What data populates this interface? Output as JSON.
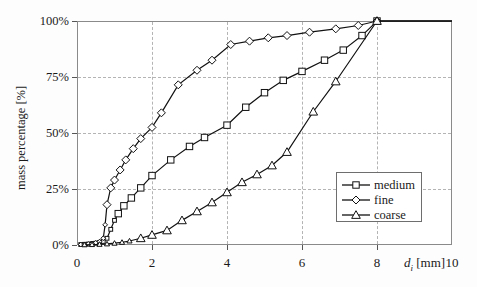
{
  "chart_data": {
    "type": "line",
    "title": "",
    "subtitle": "",
    "xlabel": "d_i [mm]",
    "ylabel": "mass percentage [%]",
    "xlim": [
      0,
      10
    ],
    "ylim": [
      0,
      100
    ],
    "grid": true,
    "legend_position": "inside-lower-right",
    "x_ticks": [
      "0",
      "2",
      "4",
      "6",
      "8",
      "10"
    ],
    "x_tick_values": [
      0,
      2,
      4,
      6,
      8,
      10
    ],
    "y_ticks": [
      "0%",
      "25%",
      "50%",
      "75%",
      "100%"
    ],
    "y_tick_values": [
      0,
      25,
      50,
      75,
      100
    ],
    "series": [
      {
        "name": "medium",
        "marker": "square",
        "points": [
          [
            0.1,
            0.2
          ],
          [
            0.2,
            0.3
          ],
          [
            0.3,
            0.4
          ],
          [
            0.4,
            0.6
          ],
          [
            0.5,
            0.8
          ],
          [
            0.6,
            1.1
          ],
          [
            0.7,
            1.6
          ],
          [
            0.8,
            3.0
          ],
          [
            0.9,
            7.0
          ],
          [
            1.0,
            11.0
          ],
          [
            1.1,
            14.0
          ],
          [
            1.25,
            17.5
          ],
          [
            1.45,
            21.0
          ],
          [
            1.7,
            25.5
          ],
          [
            2.0,
            31.0
          ],
          [
            2.5,
            38.0
          ],
          [
            3.0,
            44.0
          ],
          [
            3.4,
            48.0
          ],
          [
            4.0,
            53.5
          ],
          [
            4.5,
            61.5
          ],
          [
            5.0,
            68.0
          ],
          [
            5.5,
            73.5
          ],
          [
            6.0,
            77.5
          ],
          [
            6.6,
            82.5
          ],
          [
            7.1,
            87.0
          ],
          [
            7.6,
            93.5
          ],
          [
            8.0,
            100.0
          ],
          [
            10.0,
            100.0
          ]
        ]
      },
      {
        "name": "fine",
        "marker": "diamond",
        "points": [
          [
            0.1,
            0.2
          ],
          [
            0.2,
            0.3
          ],
          [
            0.3,
            0.5
          ],
          [
            0.4,
            0.7
          ],
          [
            0.5,
            1.0
          ],
          [
            0.6,
            1.5
          ],
          [
            0.7,
            3.0
          ],
          [
            0.75,
            9.0
          ],
          [
            0.8,
            18.0
          ],
          [
            0.9,
            25.5
          ],
          [
            1.0,
            29.0
          ],
          [
            1.15,
            33.5
          ],
          [
            1.3,
            38.0
          ],
          [
            1.5,
            43.0
          ],
          [
            1.7,
            47.5
          ],
          [
            2.0,
            52.5
          ],
          [
            2.25,
            59.0
          ],
          [
            2.7,
            71.5
          ],
          [
            3.2,
            78.0
          ],
          [
            3.6,
            82.5
          ],
          [
            4.1,
            89.5
          ],
          [
            4.6,
            91.0
          ],
          [
            5.1,
            92.5
          ],
          [
            5.6,
            93.5
          ],
          [
            6.2,
            95.0
          ],
          [
            6.9,
            96.5
          ],
          [
            7.5,
            98.0
          ],
          [
            8.0,
            100.0
          ],
          [
            10.0,
            100.0
          ]
        ]
      },
      {
        "name": "coarse",
        "marker": "triangle",
        "points": [
          [
            0.2,
            0.1
          ],
          [
            0.4,
            0.2
          ],
          [
            0.6,
            0.3
          ],
          [
            0.8,
            0.5
          ],
          [
            1.0,
            0.8
          ],
          [
            1.2,
            1.2
          ],
          [
            1.4,
            1.8
          ],
          [
            1.7,
            3.0
          ],
          [
            2.0,
            4.5
          ],
          [
            2.4,
            6.5
          ],
          [
            2.8,
            11.0
          ],
          [
            3.2,
            15.0
          ],
          [
            3.6,
            19.0
          ],
          [
            4.0,
            23.5
          ],
          [
            4.4,
            28.0
          ],
          [
            4.8,
            31.5
          ],
          [
            5.2,
            35.5
          ],
          [
            5.6,
            41.5
          ],
          [
            6.3,
            59.5
          ],
          [
            6.9,
            73.0
          ],
          [
            8.0,
            100.0
          ],
          [
            10.0,
            100.0
          ]
        ]
      }
    ]
  },
  "legend": {
    "entries": [
      {
        "label": "medium"
      },
      {
        "label": "fine"
      },
      {
        "label": "coarse"
      }
    ]
  },
  "axes": {
    "x_title_symbol": "d",
    "x_title_subscript": "i",
    "x_title_unit": "[mm]",
    "y_title": "mass percentage [%]"
  }
}
